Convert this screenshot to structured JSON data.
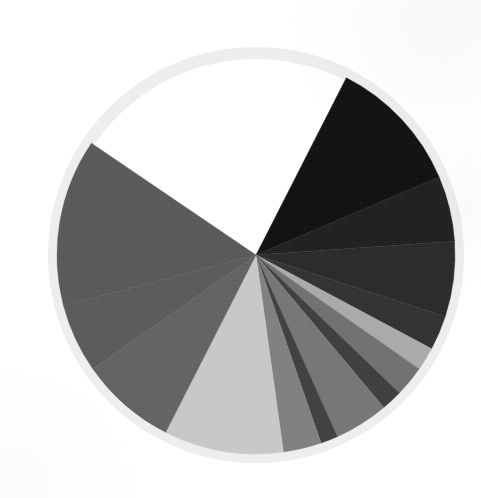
{
  "figure": {
    "width": 481,
    "height": 498,
    "background_color": "#ffffff",
    "ring_color": "#ededed",
    "ring_outer_radius": 208,
    "ring_inner_radius": 196,
    "center_x": 256,
    "center_y": 255,
    "pie_radius": 199
  },
  "chart_data": {
    "type": "pie",
    "title": "",
    "subtitle": "",
    "xlabel": "",
    "ylabel": "",
    "legend": "none",
    "grid": false,
    "start_angle_deg": -63,
    "direction": "clockwise",
    "note": "Grayscale pie; a large empty (white) wedge occupies the left side. Values are percentages of the full circle.",
    "labels": [
      "Slice 1",
      "Slice 2",
      "Slice 3",
      "Slice 4",
      "Slice 5",
      "Slice 6",
      "Slice 7",
      "Slice 8",
      "Slice 9",
      "Slice 10",
      "Slice 11",
      "Slice 12",
      "Slice 13",
      "Slice 14",
      "Empty"
    ],
    "values": [
      11.1,
      5.3,
      6.1,
      2.8,
      1.9,
      2.5,
      1.7,
      4.4,
      1.4,
      3.1,
      9.7,
      7.8,
      5.6,
      13.6,
      23.0
    ],
    "colors": [
      "#0d0d0d",
      "#1c1c1c",
      "#262626",
      "#2e2e2e",
      "#a8a8a8",
      "#6e6e6e",
      "#3a3a3a",
      "#737373",
      "#3d3d3d",
      "#7d7d7d",
      "#c6c6c6",
      "#5f5f5f",
      "#585858",
      "#565656",
      "#ffffff"
    ],
    "total": 100.0
  }
}
